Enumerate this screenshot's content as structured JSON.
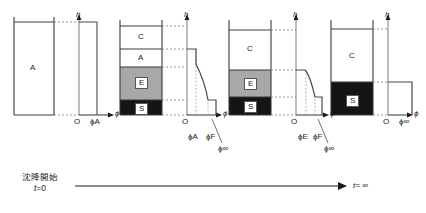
{
  "figure": {
    "type": "diagram",
    "axis_labels": {
      "height": "h",
      "concentration": "ϕ"
    },
    "origin_label": "O"
  },
  "panels": [
    {
      "id": "panel-1",
      "stage": "t = 0",
      "column_layers": [
        {
          "code": "A",
          "name": "uniform-suspension-zone",
          "fill": "#ffffff",
          "label_color": "#1a1a1a"
        }
      ],
      "profile": {
        "type": "step",
        "description": "uniform concentration over full height",
        "points": [
          [
            1,
            1
          ],
          [
            1,
            0
          ]
        ],
        "values": [
          "ϕA"
        ]
      },
      "tick_labels": [
        "ϕA"
      ],
      "callout_labels": []
    },
    {
      "id": "panel-2",
      "stage": "early settling",
      "column_layers": [
        {
          "code": "C",
          "name": "clear-liquid-zone",
          "fill": "#ffffff",
          "label_color": "#1a1a1a"
        },
        {
          "code": "A",
          "name": "uniform-suspension-zone",
          "fill": "#ffffff",
          "label_color": "#1a1a1a"
        },
        {
          "code": "E",
          "name": "variable-concentration-zone",
          "fill": "#a8a8a8",
          "label_color": "#1a1a1a"
        },
        {
          "code": "S",
          "name": "sediment-zone",
          "fill": "#151515",
          "label_color": "#1a1a1a"
        }
      ],
      "profile": {
        "type": "step-with-curve",
        "description": "zero in C, plateau phiA in A, smooth rise through E, plateau phiInf in S",
        "values": [
          "ϕA",
          "ϕF",
          "ϕ∞"
        ]
      },
      "tick_labels": [
        "ϕA",
        "ϕF"
      ],
      "callout_labels": [
        "ϕ∞"
      ]
    },
    {
      "id": "panel-3",
      "stage": "late settling",
      "column_layers": [
        {
          "code": "C",
          "name": "clear-liquid-zone",
          "fill": "#ffffff",
          "label_color": "#1a1a1a"
        },
        {
          "code": "E",
          "name": "variable-concentration-zone",
          "fill": "#a8a8a8",
          "label_color": "#1a1a1a"
        },
        {
          "code": "S",
          "name": "sediment-zone",
          "fill": "#151515",
          "label_color": "#1a1a1a"
        }
      ],
      "profile": {
        "type": "step-with-curve",
        "description": "zero in C, plateau phiE at top of E, steep drop to phiInf in S",
        "values": [
          "ϕE",
          "ϕF",
          "ϕ∞"
        ]
      },
      "tick_labels": [
        "ϕE",
        "ϕF"
      ],
      "callout_labels": [
        "ϕ∞"
      ]
    },
    {
      "id": "panel-4",
      "stage": "t = ∞",
      "column_layers": [
        {
          "code": "C",
          "name": "clear-liquid-zone",
          "fill": "#ffffff",
          "label_color": "#1a1a1a"
        },
        {
          "code": "S",
          "name": "sediment-zone",
          "fill": "#151515",
          "label_color": "#1a1a1a"
        }
      ],
      "profile": {
        "type": "step",
        "description": "zero in C, constant phiInf in S",
        "values": [
          "ϕ∞"
        ]
      },
      "tick_labels": [
        "ϕ∞"
      ],
      "callout_labels": []
    }
  ],
  "timeline": {
    "start_label_jp": "沈降開始",
    "start_label_time": "t",
    "start_label_eq": "=0",
    "end_label_time": "t",
    "end_label_eq": "= ∞"
  },
  "colors": {
    "stroke": "#3a3a3a",
    "profile_line": "#4a4a4a",
    "dotted": "#8a8a8a",
    "zone_e_fill": "#a8a8a8",
    "zone_s_fill": "#151515",
    "background": "#ffffff"
  }
}
